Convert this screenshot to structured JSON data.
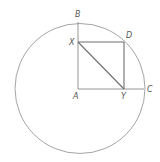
{
  "diagram": {
    "type": "geometry",
    "circle": {
      "center": "A",
      "cx": 80,
      "cy": 88.5,
      "r": 65
    },
    "points": {
      "A": {
        "x": 78,
        "y": 89,
        "label": "A"
      },
      "B": {
        "x": 78,
        "y": 23,
        "label": "B"
      },
      "C": {
        "x": 144,
        "y": 89,
        "label": "C"
      },
      "D": {
        "x": 124,
        "y": 42,
        "label": "D"
      },
      "X": {
        "x": 78,
        "y": 42,
        "label": "X"
      },
      "Y": {
        "x": 124,
        "y": 89,
        "label": "Y"
      }
    },
    "segments": [
      {
        "from": "A",
        "to": "B"
      },
      {
        "from": "A",
        "to": "C"
      },
      {
        "from": "X",
        "to": "D"
      },
      {
        "from": "D",
        "to": "Y"
      },
      {
        "from": "X",
        "to": "Y"
      }
    ],
    "labels": {
      "A": "A",
      "B": "B",
      "C": "C",
      "D": "D",
      "X": "X",
      "Y": "Y"
    },
    "colors": {
      "circle": "#9a9a9a",
      "lines": "#8a8a8a",
      "square": "#6f6f6f",
      "labels": "#555555"
    }
  }
}
